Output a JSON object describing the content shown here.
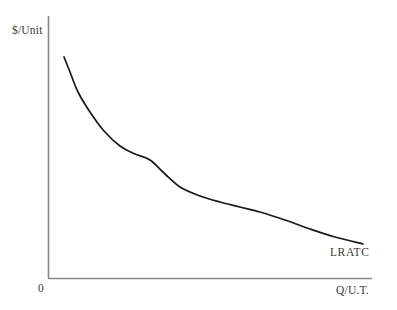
{
  "figure": {
    "background_color": "#ffffff",
    "axis_color": "#8a8a8a",
    "curve_color": "#1a1a1a",
    "label_color": "#3a3a3a"
  },
  "labels": {
    "y_axis": "$/Unit",
    "x_axis": "Q/U.T.",
    "origin": "0",
    "curve": "LRATC"
  },
  "chart_data": {
    "type": "line",
    "title": "",
    "subtitle": "",
    "xlabel": "Q/U.T.",
    "ylabel": "$/Unit",
    "origin_label": "0",
    "grid": false,
    "legend_position": "inline-right",
    "axis_ranges": {
      "x_pixel": [
        48,
        372
      ],
      "y_pixel": [
        16,
        278
      ]
    },
    "xticks": [],
    "yticks": [],
    "annotations": [
      {
        "text": "LRATC",
        "x_pixel": 330,
        "y_pixel": 258,
        "describes": "long-run average total cost curve"
      }
    ],
    "series": [
      {
        "name": "LRATC",
        "color": "#1a1a1a",
        "points_pixel": [
          [
            64,
            57
          ],
          [
            70,
            72
          ],
          [
            78,
            92
          ],
          [
            90,
            112
          ],
          [
            104,
            131
          ],
          [
            120,
            146
          ],
          [
            135,
            154
          ],
          [
            150,
            160
          ],
          [
            165,
            174
          ],
          [
            180,
            187
          ],
          [
            200,
            196
          ],
          [
            220,
            202
          ],
          [
            240,
            207
          ],
          [
            260,
            212
          ],
          [
            285,
            220
          ],
          [
            310,
            229
          ],
          [
            335,
            237
          ],
          [
            363,
            244
          ]
        ]
      }
    ]
  }
}
